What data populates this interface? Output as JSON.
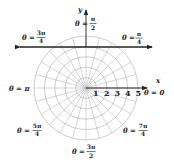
{
  "figure": {
    "type": "polar-grid",
    "center": [
      86,
      88
    ],
    "ring_spacing": 10.4,
    "ring_count": 5,
    "radial_step_deg": 15,
    "grid_color": "#b8b8b8",
    "axis_color": "#222222",
    "axis_labels": {
      "x": "x",
      "y": "y"
    },
    "radius_ticks": [
      "1",
      "2",
      "3",
      "4",
      "5"
    ],
    "angle_labels": [
      {
        "id": "theta-0",
        "prefix": "θ = ",
        "whole": "0"
      },
      {
        "id": "theta-pi-4",
        "prefix": "θ = ",
        "num": "π",
        "den": "4"
      },
      {
        "id": "theta-pi-2",
        "prefix": "θ = ",
        "num": "π",
        "den": "2"
      },
      {
        "id": "theta-3pi-4",
        "prefix": "θ = ",
        "num": "3π",
        "den": "4"
      },
      {
        "id": "theta-pi",
        "prefix": "θ = ",
        "whole": "π"
      },
      {
        "id": "theta-5pi-4",
        "prefix": "θ = ",
        "num": "5π",
        "den": "4"
      },
      {
        "id": "theta-3pi-2",
        "prefix": "θ = ",
        "num": "3π",
        "den": "2"
      },
      {
        "id": "theta-7pi-4",
        "prefix": "θ = ",
        "num": "7π",
        "den": "4"
      }
    ],
    "horizontal_line_y": 47
  }
}
